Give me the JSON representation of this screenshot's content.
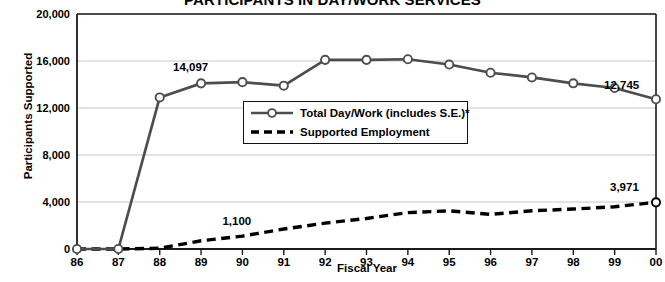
{
  "chart_data": {
    "type": "line",
    "title": "PARTICIPANTS IN DAY/WORK SERVICES",
    "xlabel": "Fiscal Year",
    "ylabel": "Participants Supported",
    "categories": [
      "86",
      "87",
      "88",
      "89",
      "90",
      "91",
      "92",
      "93",
      "94",
      "95",
      "96",
      "97",
      "98",
      "99",
      "00"
    ],
    "ylim": [
      0,
      20000
    ],
    "yticks": [
      "0",
      "4,000",
      "8,000",
      "12,000",
      "16,000",
      "20,000"
    ],
    "ytick_values": [
      0,
      4000,
      8000,
      12000,
      16000,
      20000
    ],
    "grid": true,
    "legend_position": "center",
    "series": [
      {
        "name": "Total Day/Work (includes S.E.)*",
        "style": "solid-with-circle-markers",
        "values": [
          0,
          0,
          12900,
          14097,
          14200,
          13900,
          16100,
          16100,
          16150,
          15700,
          15000,
          14600,
          14100,
          13700,
          12745
        ]
      },
      {
        "name": "Supported Employment",
        "style": "dashed",
        "values": [
          0,
          0,
          60,
          700,
          1100,
          1700,
          2200,
          2600,
          3100,
          3250,
          2950,
          3250,
          3400,
          3600,
          3971
        ]
      }
    ],
    "annotations": [
      {
        "text": "14,097",
        "series": 0,
        "category": "89"
      },
      {
        "text": "12,745",
        "series": 0,
        "category": "00"
      },
      {
        "text": "1,100",
        "series": 1,
        "category": "90"
      },
      {
        "text": "3,971",
        "series": 1,
        "category": "00"
      }
    ],
    "colors": {
      "line_primary": "#4d4d4d",
      "line_secondary": "#000000",
      "marker_fill": "#ffffff",
      "grid": "#bfbfbf",
      "axis": "#1a1a1a",
      "text": "#000000"
    }
  },
  "legend": {
    "items": [
      {
        "label": "Total Day/Work (includes S.E.)*"
      },
      {
        "label": "Supported Employment"
      }
    ]
  },
  "axes": {
    "x_title": "Fiscal Year",
    "y_title": "Participants Supported"
  }
}
